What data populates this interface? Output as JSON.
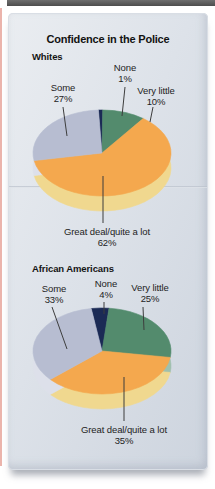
{
  "figure": {
    "title": "Confidence in the Police"
  },
  "chart_data": [
    {
      "type": "pie",
      "group": "Whites",
      "title": "Confidence in the Police",
      "legend": "labels-with-leader-lines",
      "start_angle_deg": -3,
      "slices": [
        {
          "label": "None",
          "value": 1,
          "pct_label": "1%",
          "color": "#1b2a55",
          "side_color": "#7d89ab"
        },
        {
          "label": "Very little",
          "value": 10,
          "pct_label": "10%",
          "color": "#538b6d",
          "side_color": "#9fc0ad"
        },
        {
          "label": "Great deal/quite a lot",
          "value": 62,
          "pct_label": "62%",
          "color": "#f4a84e",
          "side_color": "#f0d88f"
        },
        {
          "label": "Some",
          "value": 27,
          "pct_label": "27%",
          "color": "#b7bdd1",
          "side_color": "#dde0ea"
        }
      ]
    },
    {
      "type": "pie",
      "group": "African Americans",
      "title": "Confidence in the Police",
      "legend": "labels-with-leader-lines",
      "start_angle_deg": -9,
      "slices": [
        {
          "label": "None",
          "value": 4,
          "pct_label": "4%",
          "color": "#1b2a55",
          "side_color": "#7d89ab"
        },
        {
          "label": "Very little",
          "value": 25,
          "pct_label": "25%",
          "color": "#538b6d",
          "side_color": "#9fc0ad"
        },
        {
          "label": "Great deal/quite a lot",
          "value": 35,
          "pct_label": "35%",
          "color": "#f4a84e",
          "side_color": "#f0d88f"
        },
        {
          "label": "Some",
          "value": 33,
          "pct_label": "33%",
          "color": "#b7bdd1",
          "side_color": "#dde0ea"
        }
      ]
    }
  ]
}
